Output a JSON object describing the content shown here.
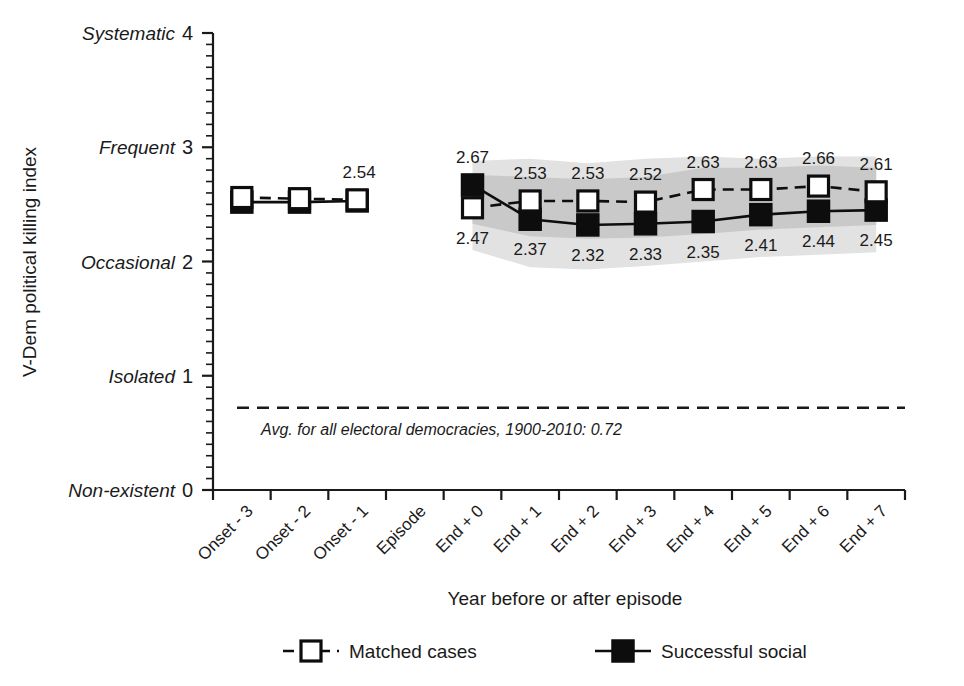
{
  "chart_data": {
    "type": "line",
    "title": "",
    "xlabel": "Year before or after episode",
    "ylabel": "V-Dem political killing index",
    "ylim": [
      0,
      4
    ],
    "grid": false,
    "legend_position": "bottom",
    "categories": [
      "Onset - 3",
      "Onset - 2",
      "Onset - 1",
      "Episode",
      "End + 0",
      "End + 1",
      "End + 2",
      "End + 3",
      "End + 4",
      "End + 5",
      "End + 6",
      "End + 7"
    ],
    "ytick_values": [
      "0",
      "1",
      "2",
      "3",
      "4"
    ],
    "ytick_categories": [
      "Non-existent",
      "Isolated",
      "Occasional",
      "Frequent",
      "Systematic"
    ],
    "yminor_tick_step": 0.1,
    "series": [
      {
        "name": "Matched cases",
        "marker": "open-square",
        "linestyle": "dashed",
        "x": [
          "Onset - 3",
          "Onset - 2",
          "Onset - 1",
          "End + 0",
          "End + 1",
          "End + 2",
          "End + 3",
          "End + 4",
          "End + 5",
          "End + 6",
          "End + 7"
        ],
        "values": [
          2.56,
          2.55,
          2.54,
          2.47,
          2.53,
          2.53,
          2.52,
          2.63,
          2.63,
          2.66,
          2.61
        ],
        "labels": [
          "",
          "",
          "2.54",
          "2.47",
          "2.53",
          "2.53",
          "2.52",
          "2.63",
          "2.63",
          "2.66",
          "2.61"
        ]
      },
      {
        "name": "Successful social",
        "marker": "filled-square",
        "linestyle": "solid",
        "x": [
          "Onset - 3",
          "Onset - 2",
          "Onset - 1",
          "End + 0",
          "End + 1",
          "End + 2",
          "End + 3",
          "End + 4",
          "End + 5",
          "End + 6",
          "End + 7"
        ],
        "values": [
          2.52,
          2.52,
          2.53,
          2.67,
          2.37,
          2.32,
          2.33,
          2.35,
          2.41,
          2.44,
          2.45
        ],
        "labels": [
          "",
          "",
          "",
          "2.67",
          "2.37",
          "2.32",
          "2.33",
          "2.35",
          "2.41",
          "2.44",
          "2.45"
        ]
      }
    ],
    "confidence_bands": [
      {
        "name": "outer-band",
        "color": "#e2e2e2",
        "x": [
          "End + 0",
          "End + 1",
          "End + 2",
          "End + 3",
          "End + 4",
          "End + 5",
          "End + 6",
          "End + 7"
        ],
        "upper": [
          2.88,
          2.9,
          2.86,
          2.9,
          2.92,
          2.9,
          2.92,
          2.92
        ],
        "lower": [
          2.1,
          1.95,
          1.93,
          1.96,
          2.0,
          2.04,
          2.06,
          2.08
        ]
      },
      {
        "name": "inner-band",
        "color": "#c9c9c9",
        "x": [
          "End + 0",
          "End + 1",
          "End + 2",
          "End + 3",
          "End + 4",
          "End + 5",
          "End + 6",
          "End + 7"
        ],
        "upper": [
          2.76,
          2.74,
          2.72,
          2.74,
          2.82,
          2.82,
          2.84,
          2.82
        ],
        "lower": [
          2.33,
          2.22,
          2.2,
          2.21,
          2.24,
          2.28,
          2.3,
          2.32
        ]
      }
    ],
    "reference_line": {
      "value": 0.72,
      "note": "Avg. for all electoral democracies, 1900-2010:  0.72",
      "linestyle": "dashed"
    },
    "legend": [
      {
        "label": "Matched cases",
        "marker": "open-square",
        "linestyle": "dashed"
      },
      {
        "label": "Successful social",
        "marker": "filled-square",
        "linestyle": "solid"
      }
    ]
  }
}
